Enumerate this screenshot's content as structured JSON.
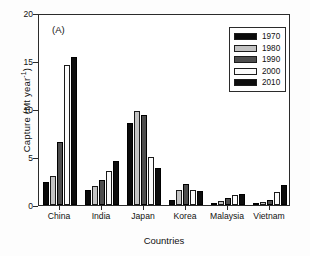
{
  "panel_label": "(A)",
  "chart_data": {
    "type": "bar",
    "title": "",
    "subtitle": "",
    "xlabel": "Countries",
    "ylabel": "Capture (Mt year",
    "ylabel_sup": "-1",
    "ylabel_tail": ")",
    "ylim": [
      0,
      20
    ],
    "yticks": [
      0,
      5,
      10,
      15,
      20
    ],
    "ytick_labels": [
      "0",
      "5",
      "10",
      "15",
      "20"
    ],
    "grid": false,
    "legend_position": "upper-right",
    "categories": [
      "China",
      "India",
      "Japan",
      "Korea",
      "Malaysia",
      "Vietnam"
    ],
    "series": [
      {
        "name": "1970",
        "color": "#0a0a0a",
        "values": [
          2.4,
          1.6,
          8.5,
          0.5,
          0.15,
          0.2
        ]
      },
      {
        "name": "1980",
        "color": "#c3c3c3",
        "values": [
          3.0,
          2.0,
          9.8,
          1.6,
          0.4,
          0.3
        ]
      },
      {
        "name": "1990",
        "color": "#4d4d4d",
        "values": [
          6.6,
          2.6,
          9.4,
          2.2,
          0.7,
          0.55
        ]
      },
      {
        "name": "2000",
        "color": "#fbfbfb",
        "values": [
          14.6,
          3.5,
          5.0,
          1.6,
          1.0,
          1.35
        ]
      },
      {
        "name": "2010",
        "color": "#0d0d0d",
        "values": [
          15.4,
          4.6,
          3.9,
          1.5,
          1.1,
          2.1
        ]
      }
    ]
  }
}
